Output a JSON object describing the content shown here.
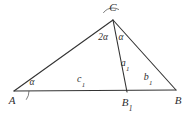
{
  "figure": {
    "stroke_color": "#333333",
    "background_color": "#ffffff",
    "stroke_width": 1.1
  },
  "vertices": [
    {
      "name": "A",
      "label": "A",
      "x": 14,
      "y": 91
    },
    {
      "name": "B",
      "label": "B",
      "x": 176,
      "y": 90
    },
    {
      "name": "C",
      "label": "C",
      "x": 113,
      "y": 20
    },
    {
      "name": "B1",
      "label": "B",
      "sub": "1",
      "x": 127,
      "y": 92
    }
  ],
  "vertex_labels": [
    {
      "name": "label-A",
      "text": "A",
      "sub": "",
      "x": 12,
      "y": 102
    },
    {
      "name": "label-B1",
      "text": "B",
      "sub": "1",
      "x": 127,
      "y": 104
    },
    {
      "name": "label-B",
      "text": "B",
      "sub": "",
      "x": 178,
      "y": 102
    },
    {
      "name": "label-C",
      "text": "C",
      "sub": "",
      "x": 113,
      "y": 9
    }
  ],
  "segments": [
    {
      "name": "side-AC",
      "from": "A",
      "to": "C",
      "x1": 14,
      "y1": 91,
      "x2": 113,
      "y2": 20
    },
    {
      "name": "side-CB",
      "from": "C",
      "to": "B",
      "x1": 113,
      "y1": 20,
      "x2": 176,
      "y2": 90
    },
    {
      "name": "base-AB",
      "from": "A",
      "to": "B",
      "x1": 14,
      "y1": 91,
      "x2": 176,
      "y2": 90
    },
    {
      "name": "cevian-CB1",
      "from": "C",
      "to": "B1",
      "x1": 113,
      "y1": 20,
      "x2": 127,
      "y2": 92
    }
  ],
  "side_labels": [
    {
      "name": "label-c1",
      "text": "c",
      "sub": "1",
      "x": 81,
      "y": 80
    },
    {
      "name": "label-b1",
      "text": "b",
      "sub": "1",
      "x": 148,
      "y": 78
    },
    {
      "name": "label-a1",
      "text": "a",
      "sub": "1",
      "x": 125,
      "y": 64
    }
  ],
  "angle_labels": [
    {
      "name": "angle-alpha-at-A",
      "text": "α",
      "sub": "",
      "x": 32,
      "y": 83
    },
    {
      "name": "angle-two-alpha-at-C",
      "text": "2α",
      "sub": "",
      "x": 103,
      "y": 38
    },
    {
      "name": "angle-alpha-at-C",
      "text": "α",
      "sub": "",
      "x": 121,
      "y": 38
    }
  ],
  "angle_arcs": [
    {
      "name": "arc-at-A",
      "cx": 14,
      "cy": 91,
      "r": 15,
      "start_deg": -35.6,
      "end_deg": 0
    },
    {
      "name": "arc-at-C-left",
      "cx": 113,
      "cy": 20,
      "r": 12,
      "start_deg": 90,
      "end_deg": 144
    },
    {
      "name": "arc-at-C-right",
      "cx": 113,
      "cy": 20,
      "r": 12,
      "start_deg": 60,
      "end_deg": 90
    }
  ]
}
